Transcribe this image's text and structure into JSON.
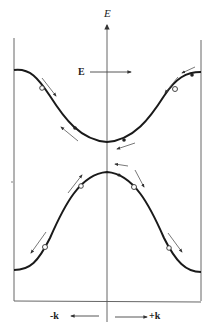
{
  "diagram": {
    "title": "",
    "energy_axis_label": "E",
    "field_label": "E",
    "k_neg_label": "-k",
    "k_pos_label": "+k",
    "colors": {
      "curve": "#1a1a1a",
      "line": "#555555",
      "arrow": "#444444"
    },
    "bands": [
      {
        "name": "upper band (conduction)",
        "shape": "cosine valley",
        "min_at": "k=0"
      },
      {
        "name": "lower band (valence)",
        "shape": "cosine hill",
        "max_at": "k=0"
      }
    ],
    "markers": {
      "filled": "electrons",
      "open": "holes"
    }
  }
}
